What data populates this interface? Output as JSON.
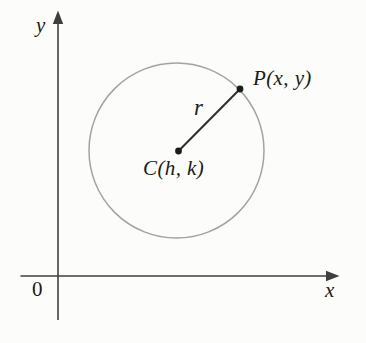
{
  "figure": {
    "labels": {
      "y_axis": "y",
      "x_axis": "x",
      "origin": "0",
      "point_p": "P(x, y)",
      "center_c": "C(h, k)",
      "radius": "r"
    },
    "colors": {
      "background": "#fcfcfa",
      "axis": "#3f3f3f",
      "circle_stroke": "#a3a3a3",
      "radius_line": "#2e2e2e",
      "point_fill": "#1c1c1c",
      "text": "#1b1b1b"
    }
  }
}
